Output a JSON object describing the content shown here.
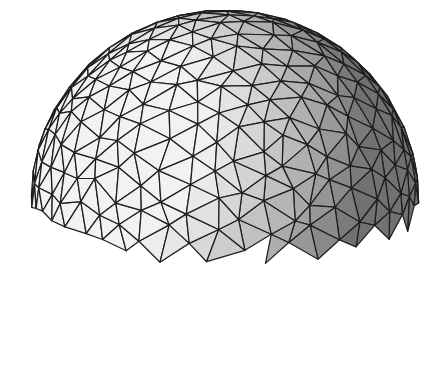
{
  "figure": {
    "caption": "",
    "canvas": {
      "width": 430,
      "height": 379
    },
    "background_color": "#ffffff",
    "edge_color": "#1e1e1e",
    "shading": {
      "style": "flat grayscale",
      "lightest": "#f2f2f2",
      "darkest": "#5a5a5a",
      "light_from": "upper-left-front"
    },
    "projection": {
      "center_x": 225,
      "center_y": 200,
      "radius": 194,
      "view_tilt_deg": 14,
      "base_cut_y": 0.0
    },
    "mesh": {
      "type": "icosphere-hemisphere",
      "subdivisions": 3,
      "jitter": 0.06
    }
  }
}
